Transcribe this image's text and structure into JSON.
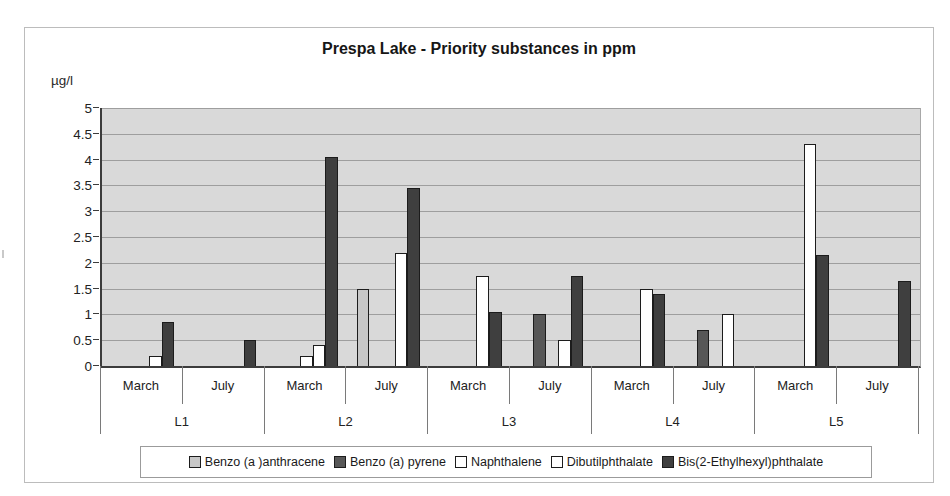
{
  "chart_data": {
    "type": "bar",
    "title": "Prespa Lake - Priority substances in ppm",
    "ylabel": "µg/l",
    "ylim": [
      0,
      5
    ],
    "ytick_step": 0.5,
    "ytick_labels": [
      "0",
      "0.5",
      "1",
      "1.5",
      "2",
      "2.5",
      "3",
      "3.5",
      "4",
      "4.5",
      "5"
    ],
    "grid": true,
    "legend_position": "bottom",
    "group_labels": [
      "L1",
      "L2",
      "L3",
      "L4",
      "L5"
    ],
    "categories": [
      "March",
      "July",
      "March",
      "July",
      "March",
      "July",
      "March",
      "July",
      "March",
      "July"
    ],
    "series": [
      {
        "name": "Benzo (a )anthracene",
        "color": "#c7c7c7",
        "values": [
          0,
          0,
          0,
          1.5,
          0,
          0,
          0,
          0,
          0,
          0
        ]
      },
      {
        "name": "Benzo (a) pyrene",
        "color": "#575757",
        "values": [
          0,
          0,
          0,
          0,
          0,
          1,
          0,
          0.7,
          0,
          0
        ]
      },
      {
        "name": "Naphthalene",
        "color": "#ffffff",
        "values": [
          0,
          0,
          0.2,
          0,
          0,
          0,
          0,
          0,
          0,
          0
        ]
      },
      {
        "name": "Dibutilphthalate",
        "color": "#ffffff",
        "values": [
          0.2,
          0,
          0.4,
          2.2,
          1.75,
          0.5,
          1.5,
          1,
          4.3,
          0
        ]
      },
      {
        "name": "Bis(2-Ethylhexyl)phthalate",
        "color": "#3f3f3f",
        "values": [
          0.85,
          0.5,
          4.05,
          3.45,
          1.05,
          1.75,
          1.4,
          0,
          2.15,
          1.65
        ]
      }
    ]
  },
  "colors": {
    "plot_background": "#d9d9d9",
    "gridline": "#9e9e9e",
    "axis": "#3c3c3c",
    "tick": "#7a7a7a",
    "bar_outline": "#1c1c1c",
    "figure_border": "#bcbcbc",
    "text": "#1e1e1e"
  }
}
